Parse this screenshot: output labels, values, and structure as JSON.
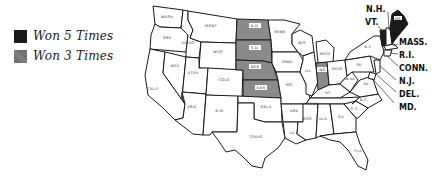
{
  "legend": {
    "items": [
      {
        "label": "Won 5 Times",
        "color": "#1a1a1a"
      },
      {
        "label": "Won 3 Times",
        "color": "#8a8a8a"
      }
    ]
  },
  "map": {
    "states": {
      "wash": "WASH",
      "ore": "ORE",
      "calif": "CALIF",
      "idaho": "IDAHO",
      "nev": "NEV",
      "mont": "MONT",
      "wyo": "WYO",
      "utah": "UTAH",
      "ariz": "ARIZ",
      "colo": "COLO",
      "nm": "N.M.",
      "nd": "N.D.",
      "sd": "S.D.",
      "neb": "NEB",
      "kan": "KAN",
      "okla": "OKLA",
      "texas": "TEXAS",
      "minn": "MINN",
      "iowa": "IOWA",
      "mo": "MO",
      "ark": "ARK",
      "la": "LA",
      "wis": "WIS",
      "ill": "ILL",
      "mich": "MICH",
      "ind": "IND",
      "ohio": "OHIO",
      "ky": "KY",
      "tenn": "TENN",
      "miss": "MISS",
      "ala": "ALA",
      "ga": "GA",
      "fla": "FLA",
      "sc": "S.C.",
      "nc": "N.C.",
      "va": "VA",
      "wva": "W.VA",
      "pa": "PA",
      "ny": "N.Y.",
      "me": "ME"
    },
    "external_labels": {
      "nh": "N.H.",
      "vt": "VT.",
      "mass": "MASS.",
      "ri": "R.I.",
      "conn": "CONN.",
      "nj": "N.J.",
      "del": "DEL.",
      "md": "MD."
    },
    "won_5_times": [
      "ME",
      "VT"
    ],
    "won_3_times": [
      "N.D.",
      "S.D.",
      "NEB",
      "KAN",
      "IND"
    ]
  }
}
